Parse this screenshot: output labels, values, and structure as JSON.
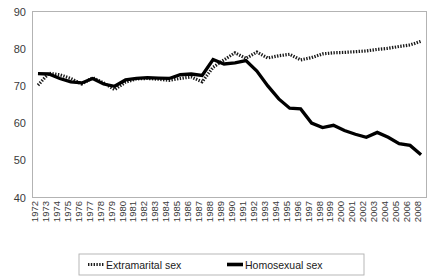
{
  "chart_data": {
    "type": "line",
    "title": "",
    "xlabel": "",
    "ylabel": "",
    "ylim": [
      40,
      90
    ],
    "yticks": [
      40,
      50,
      60,
      70,
      80,
      90
    ],
    "grid": false,
    "legend_position": "bottom",
    "categories": [
      "1972",
      "1973",
      "1974",
      "1975",
      "1976",
      "1977",
      "1978",
      "1979",
      "1980",
      "1981",
      "1982",
      "1983",
      "1984",
      "1985",
      "1986",
      "1987",
      "1988",
      "1989",
      "1990",
      "1991",
      "1992",
      "1993",
      "1994",
      "1995",
      "1996",
      "1997",
      "1998",
      "1999",
      "2000",
      "2001",
      "2002",
      "2003",
      "2004",
      "2005",
      "2006",
      "2008"
    ],
    "series": [
      {
        "name": "Extramarital sex",
        "style": "dotted",
        "color": "#1a1a1a",
        "values": [
          70.2,
          73.4,
          73.0,
          72.0,
          70.5,
          72.2,
          70.8,
          69.0,
          71.0,
          71.9,
          72.0,
          71.8,
          71.5,
          72.0,
          72.4,
          71.1,
          75.0,
          77.0,
          78.9,
          77.4,
          79.1,
          77.5,
          78.1,
          78.5,
          77.0,
          77.6,
          78.6,
          78.9,
          79.0,
          79.2,
          79.4,
          79.8,
          80.1,
          80.6,
          81.0,
          82.0
        ]
      },
      {
        "name": "Homosexual sex",
        "style": "solid",
        "color": "#000000",
        "values": [
          73.3,
          73.2,
          72.0,
          71.1,
          70.8,
          72.0,
          70.5,
          69.9,
          71.6,
          72.0,
          72.2,
          72.1,
          72.0,
          73.0,
          73.2,
          72.8,
          77.1,
          75.9,
          76.2,
          76.8,
          74.0,
          70.0,
          66.5,
          64.0,
          63.8,
          60.0,
          58.8,
          59.4,
          58.0,
          57.0,
          56.2,
          57.5,
          56.2,
          54.5,
          54.0,
          51.5
        ]
      }
    ]
  },
  "legend": {
    "items": [
      {
        "label": "Extramarital  sex",
        "marker": "dotted-line-marker"
      },
      {
        "label": "Homosexual sex",
        "marker": "solid-line-marker"
      }
    ]
  }
}
